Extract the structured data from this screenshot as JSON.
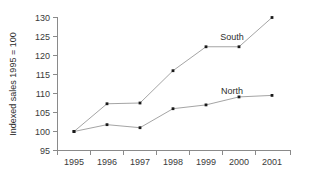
{
  "chart_data": {
    "type": "line",
    "title": "",
    "xlabel": "",
    "ylabel": "Indexed sales 1995 = 100",
    "categories": [
      "1995",
      "1996",
      "1997",
      "1998",
      "1999",
      "2000",
      "2001"
    ],
    "x": [
      1995,
      1996,
      1997,
      1998,
      1999,
      2000,
      2001
    ],
    "series": [
      {
        "name": "South",
        "values": [
          100,
          107.3,
          107.5,
          116,
          122.3,
          122.3,
          130
        ],
        "color": "#9a9a9a"
      },
      {
        "name": "North",
        "values": [
          100,
          101.8,
          101,
          106,
          107,
          109.1,
          109.5
        ],
        "color": "#9a9a9a"
      }
    ],
    "ylim": [
      95,
      130
    ],
    "yticks": [
      95,
      100,
      105,
      110,
      115,
      120,
      125,
      130
    ],
    "ytick_labels": [
      "95",
      "100",
      "105",
      "110",
      "115",
      "120",
      "125",
      "130"
    ],
    "xtick_labels": [
      "1995",
      "1996",
      "1997",
      "1998",
      "1999",
      "2000",
      "2001"
    ],
    "grid": false,
    "legend_position": "inline-annotations",
    "annotations": [
      {
        "text": "South",
        "series": "South",
        "near_x": 1999
      },
      {
        "text": "North",
        "series": "North",
        "near_x": 2000
      }
    ],
    "marker": "square",
    "axis_color": "#8a8a8a",
    "line_color": "#9a9a9a",
    "marker_color": "#1a1a1a",
    "background": "#ffffff"
  }
}
